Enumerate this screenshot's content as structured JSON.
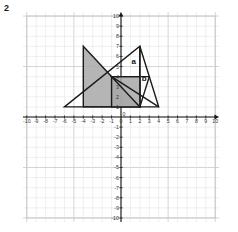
{
  "question_number": "2",
  "chart_data": {
    "type": "scatter",
    "title": "",
    "xlabel": "x",
    "ylabel": "y",
    "xlim": [
      -10.4,
      10.4
    ],
    "ylim": [
      -10.4,
      10.4
    ],
    "grid": true,
    "grid_step": 1,
    "legend_position": "none",
    "x_ticks": [
      -10,
      -9,
      -8,
      -7,
      -6,
      -5,
      -4,
      -3,
      -2,
      -1,
      0,
      1,
      2,
      3,
      4,
      5,
      6,
      7,
      8,
      9,
      10
    ],
    "y_ticks": [
      -10,
      -9,
      -8,
      -7,
      -6,
      -5,
      -4,
      -3,
      -2,
      -1,
      0,
      1,
      2,
      3,
      4,
      5,
      6,
      7,
      8,
      9,
      10
    ],
    "x_tick_labels": [
      "-10",
      "-9",
      "-8",
      "-7",
      "-6",
      "-5",
      "-4",
      "-3",
      "-2",
      "-1",
      "0",
      "1",
      "2",
      "3",
      "4",
      "5",
      "6",
      "7",
      "8",
      "9",
      "10"
    ],
    "y_tick_labels": [
      "-10",
      "-9",
      "-8",
      "-7",
      "-6",
      "-5",
      "-4",
      "-3",
      "-2",
      "-1",
      "0",
      "1",
      "2",
      "3",
      "4",
      "5",
      "6",
      "7",
      "8",
      "9",
      "10"
    ],
    "axis_arrow_labels": {
      "x": "x",
      "y": "y"
    },
    "shapes": [
      {
        "name": "large-shaded-triangle",
        "type": "polygon",
        "points": [
          [
            -4,
            7
          ],
          [
            -4,
            1
          ],
          [
            2,
            1
          ]
        ],
        "fill": "#a8a8a8",
        "fill_opacity": 0.85,
        "stroke": "#1a1a1a",
        "stroke_width": 1.4
      },
      {
        "name": "large-outline-triangle",
        "type": "polygon",
        "points": [
          [
            -6,
            1
          ],
          [
            2,
            1
          ],
          [
            2,
            7
          ]
        ],
        "fill": "none",
        "stroke": "#1a1a1a",
        "stroke_width": 1.4
      },
      {
        "name": "right-shaded-triangle",
        "type": "polygon",
        "points": [
          [
            2,
            7
          ],
          [
            2,
            1
          ],
          [
            4,
            1
          ]
        ],
        "fill": "none",
        "stroke": "#1a1a1a",
        "stroke_width": 1.4
      },
      {
        "name": "small-shaded-quad",
        "type": "polygon",
        "points": [
          [
            -1,
            4
          ],
          [
            -1,
            1
          ],
          [
            2,
            1
          ],
          [
            2,
            4
          ]
        ],
        "fill": "#a8a8a8",
        "fill_opacity": 0.85,
        "stroke": "#1a1a1a",
        "stroke_width": 1.4
      },
      {
        "name": "small-triangle-b",
        "type": "polygon",
        "points": [
          [
            -1,
            4
          ],
          [
            3,
            4
          ],
          [
            2,
            1
          ]
        ],
        "fill": "none",
        "stroke": "#1a1a1a",
        "stroke_width": 1.4
      },
      {
        "name": "diagonal-line-b",
        "type": "line",
        "points": [
          [
            -1,
            4
          ],
          [
            4,
            1
          ]
        ],
        "stroke": "#1a1a1a",
        "stroke_width": 1.4
      }
    ],
    "annotations": [
      {
        "name": "label-a",
        "text": "a",
        "x": 1.35,
        "y": 5.25
      },
      {
        "name": "label-b",
        "text": "b",
        "x": 2.45,
        "y": 3.55
      }
    ],
    "colors": {
      "grid": "#c9c9c9",
      "grid_minor": "#e4e4e4",
      "axis": "#1a1a1a",
      "shape_fill": "#a8a8a8",
      "shape_stroke": "#1a1a1a",
      "tick_text": "#333333"
    }
  }
}
